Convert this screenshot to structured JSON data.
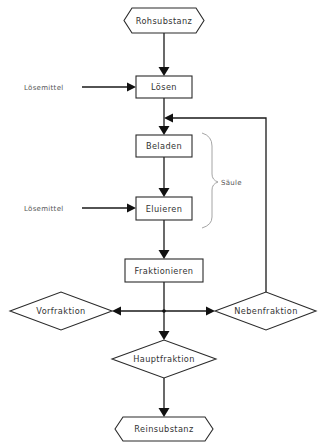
{
  "diagram": {
    "type": "flowchart",
    "nodes": {
      "start": {
        "label": "Rohsubstanz",
        "shape": "hexagon"
      },
      "loesen": {
        "label": "Lösen",
        "shape": "rectangle"
      },
      "beladen": {
        "label": "Beladen",
        "shape": "rectangle"
      },
      "eluieren": {
        "label": "Eluieren",
        "shape": "rectangle"
      },
      "fraktionieren": {
        "label": "Fraktionieren",
        "shape": "rectangle"
      },
      "vorfraktion": {
        "label": "Vorfraktion",
        "shape": "diamond"
      },
      "nebenfraktion": {
        "label": "Nebenfraktion",
        "shape": "diamond"
      },
      "hauptfraktion": {
        "label": "Hauptfraktion",
        "shape": "diamond"
      },
      "end": {
        "label": "Reinsubstanz",
        "shape": "hexagon"
      }
    },
    "inputs": {
      "solvent_1": "Lösemittel",
      "solvent_2": "Lösemittel"
    },
    "group": {
      "label": "Säule",
      "members": [
        "Beladen",
        "Eluieren"
      ]
    },
    "edges": [
      {
        "from": "Rohsubstanz",
        "to": "Lösen"
      },
      {
        "from": "Lösemittel",
        "to": "Lösen"
      },
      {
        "from": "Lösen",
        "to": "Beladen"
      },
      {
        "from": "Beladen",
        "to": "Eluieren"
      },
      {
        "from": "Lösemittel",
        "to": "Eluieren"
      },
      {
        "from": "Eluieren",
        "to": "Fraktionieren"
      },
      {
        "from": "Fraktionieren",
        "to": "Vorfraktion"
      },
      {
        "from": "Fraktionieren",
        "to": "Nebenfraktion"
      },
      {
        "from": "Fraktionieren",
        "to": "Hauptfraktion"
      },
      {
        "from": "Nebenfraktion",
        "to": "Beladen",
        "note": "recycle loop"
      },
      {
        "from": "Hauptfraktion",
        "to": "Reinsubstanz"
      }
    ]
  }
}
